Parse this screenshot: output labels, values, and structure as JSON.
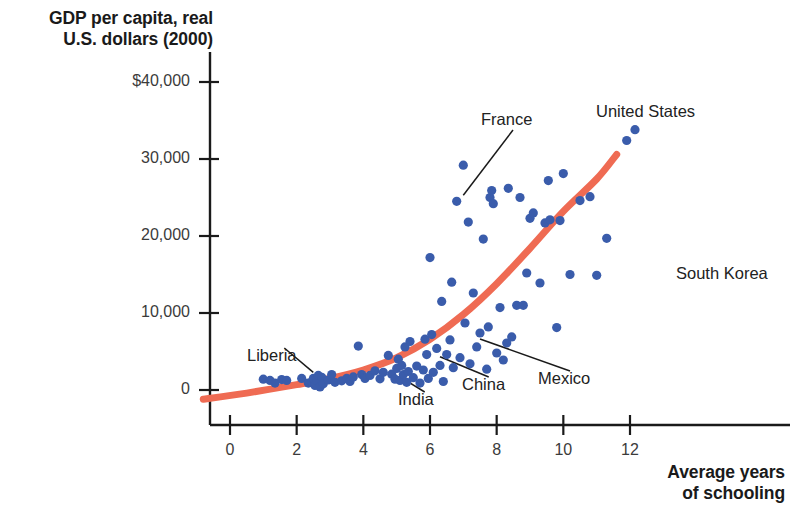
{
  "chart_data": {
    "type": "scatter",
    "title": "",
    "xlabel": "Average years of schooling",
    "ylabel": "GDP per capita, real U.S. dollars (2000)",
    "xlim": [
      -1,
      13.4
    ],
    "ylim": [
      -2600,
      42000
    ],
    "grid": false,
    "legend": null,
    "xticks": [
      0,
      2,
      4,
      6,
      8,
      10,
      12
    ],
    "xtick_labels": [
      "0",
      "2",
      "4",
      "6",
      "8",
      "10",
      "12"
    ],
    "yticks": [
      0,
      10000,
      20000,
      30000,
      40000
    ],
    "ytick_labels": [
      "0",
      "10,000",
      "20,000",
      "30,000",
      "$40,000"
    ],
    "series": [
      {
        "name": "countries",
        "marker": "circle",
        "color": "#3a5cab",
        "points": [
          [
            1.0,
            1400
          ],
          [
            1.2,
            1250
          ],
          [
            1.35,
            900
          ],
          [
            1.55,
            1350
          ],
          [
            1.7,
            1250
          ],
          [
            2.15,
            1500
          ],
          [
            2.35,
            900
          ],
          [
            2.45,
            1050
          ],
          [
            2.5,
            1500
          ],
          [
            2.55,
            600
          ],
          [
            2.6,
            1250
          ],
          [
            2.65,
            1900
          ],
          [
            2.7,
            400
          ],
          [
            2.75,
            1650
          ],
          [
            2.8,
            800
          ],
          [
            2.95,
            1300
          ],
          [
            3.05,
            2000
          ],
          [
            3.15,
            1000
          ],
          [
            3.35,
            1200
          ],
          [
            3.5,
            1500
          ],
          [
            3.6,
            1100
          ],
          [
            3.7,
            1700
          ],
          [
            3.85,
            5700
          ],
          [
            3.95,
            2000
          ],
          [
            4.05,
            1500
          ],
          [
            4.2,
            1900
          ],
          [
            4.35,
            2500
          ],
          [
            4.5,
            1450
          ],
          [
            4.6,
            2300
          ],
          [
            4.75,
            4500
          ],
          [
            4.85,
            2050
          ],
          [
            4.95,
            1400
          ],
          [
            5.0,
            2800
          ],
          [
            5.05,
            4000
          ],
          [
            5.1,
            1250
          ],
          [
            5.15,
            3200
          ],
          [
            5.2,
            2000
          ],
          [
            5.25,
            5600
          ],
          [
            5.3,
            1000
          ],
          [
            5.35,
            2400
          ],
          [
            5.4,
            6300
          ],
          [
            5.5,
            1600
          ],
          [
            5.6,
            3100
          ],
          [
            5.7,
            900
          ],
          [
            5.8,
            2600
          ],
          [
            5.85,
            6600
          ],
          [
            5.9,
            4600
          ],
          [
            5.95,
            1500
          ],
          [
            6.0,
            17200
          ],
          [
            6.05,
            7200
          ],
          [
            6.1,
            2300
          ],
          [
            6.2,
            5400
          ],
          [
            6.3,
            3200
          ],
          [
            6.35,
            11500
          ],
          [
            6.4,
            1100
          ],
          [
            6.5,
            4600
          ],
          [
            6.6,
            6500
          ],
          [
            6.65,
            14000
          ],
          [
            6.7,
            2900
          ],
          [
            6.8,
            24500
          ],
          [
            6.9,
            4200
          ],
          [
            7.0,
            29200
          ],
          [
            7.05,
            8700
          ],
          [
            7.15,
            21800
          ],
          [
            7.2,
            3400
          ],
          [
            7.3,
            12600
          ],
          [
            7.4,
            5600
          ],
          [
            7.5,
            7400
          ],
          [
            7.6,
            19600
          ],
          [
            7.7,
            2700
          ],
          [
            7.75,
            8200
          ],
          [
            7.8,
            25000
          ],
          [
            7.85,
            25900
          ],
          [
            7.9,
            24200
          ],
          [
            8.0,
            4800
          ],
          [
            8.1,
            10700
          ],
          [
            8.2,
            3900
          ],
          [
            8.3,
            6100
          ],
          [
            8.35,
            26200
          ],
          [
            8.45,
            6900
          ],
          [
            8.6,
            11000
          ],
          [
            8.7,
            25000
          ],
          [
            8.8,
            11000
          ],
          [
            8.9,
            15200
          ],
          [
            9.0,
            22300
          ],
          [
            9.1,
            23000
          ],
          [
            9.3,
            13900
          ],
          [
            9.45,
            21700
          ],
          [
            9.55,
            27200
          ],
          [
            9.6,
            22100
          ],
          [
            9.8,
            8100
          ],
          [
            9.9,
            22000
          ],
          [
            10.0,
            28100
          ],
          [
            10.2,
            15000
          ],
          [
            10.5,
            24600
          ],
          [
            10.8,
            25100
          ],
          [
            11.0,
            14900
          ],
          [
            11.3,
            19700
          ],
          [
            11.9,
            32400
          ],
          [
            12.15,
            33800
          ]
        ]
      }
    ],
    "trend_line": {
      "name": "fitted curve",
      "color": "#ef6b53",
      "points": [
        [
          -0.8,
          -1200
        ],
        [
          0.5,
          -400
        ],
        [
          2.0,
          700
        ],
        [
          3.0,
          1500
        ],
        [
          4.0,
          2600
        ],
        [
          5.0,
          4200
        ],
        [
          6.0,
          6600
        ],
        [
          7.0,
          9800
        ],
        [
          8.0,
          13800
        ],
        [
          9.0,
          18400
        ],
        [
          10.0,
          23200
        ],
        [
          11.0,
          27400
        ],
        [
          11.6,
          30600
        ]
      ]
    },
    "annotations": [
      {
        "label": "France",
        "text_x": 481,
        "text_y": 110,
        "point": [
          7.0,
          24500
        ]
      },
      {
        "label": "United States",
        "text_x": 596,
        "text_y": 102,
        "point": [
          12.15,
          33800
        ]
      },
      {
        "label": "South Korea",
        "text_x": 676,
        "text_y": 264,
        "point": [
          11.0,
          14900
        ]
      },
      {
        "label": "Liberia",
        "text_x": 247,
        "text_y": 346,
        "point": [
          2.5,
          1500
        ]
      },
      {
        "label": "India",
        "text_x": 398,
        "text_y": 390,
        "point": [
          5.1,
          2500
        ]
      },
      {
        "label": "China",
        "text_x": 462,
        "text_y": 375,
        "point": [
          6.3,
          5100
        ]
      },
      {
        "label": "Mexico",
        "text_x": 538,
        "text_y": 369,
        "point": [
          7.5,
          7400
        ]
      }
    ]
  },
  "axes": {
    "y_title_line1": "GDP per capita, real",
    "y_title_line2": "U.S. dollars (2000)",
    "x_title_line1": "Average years",
    "x_title_line2": "of schooling"
  },
  "colors": {
    "point": "#3a5cab",
    "trend": "#ef6b53",
    "axis": "#1a1a1a",
    "tick_text": "#3b3b3b",
    "label_text": "#222222"
  }
}
